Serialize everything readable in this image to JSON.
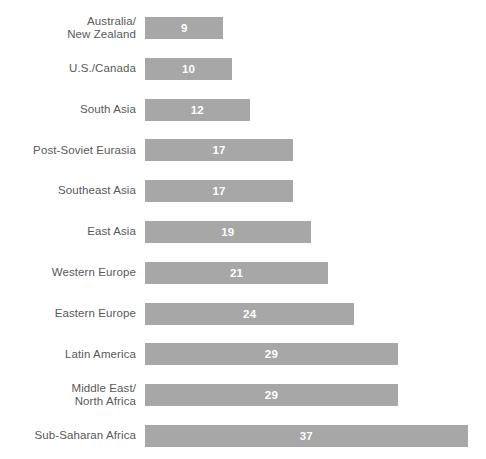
{
  "chart_data": {
    "type": "bar",
    "orientation": "horizontal",
    "title": "",
    "subtitle": "",
    "xlabel": "",
    "ylabel": "",
    "grid": false,
    "legend": null,
    "axis_visible": false,
    "tick_labels": [],
    "xlim": [
      0,
      37
    ],
    "bar_color": "#a7a7a7",
    "label_color": "#58595b",
    "value_label_color": "#ffffff",
    "background_color": "#ffffff",
    "categories": [
      "Australia/\nNew Zealand",
      "U.S./Canada",
      "South Asia",
      "Post-Soviet Eurasia",
      "Southeast Asia",
      "East Asia",
      "Western Europe",
      "Eastern Europe",
      "Latin America",
      "Middle East/\nNorth Africa",
      "Sub-Saharan Africa"
    ],
    "values": [
      9,
      10,
      12,
      17,
      17,
      19,
      21,
      24,
      29,
      29,
      37
    ],
    "value_labels": [
      "9",
      "10",
      "12",
      "17",
      "17",
      "19",
      "21",
      "24",
      "29",
      "29",
      "37"
    ]
  }
}
